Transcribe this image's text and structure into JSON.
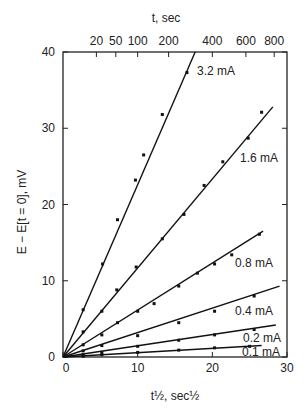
{
  "chart_data": {
    "type": "line",
    "title": "",
    "xlabel": "t½, sec½",
    "ylabel": "E − E[t = 0], mV",
    "top_axis_label": "t, sec",
    "xlim": [
      0,
      30
    ],
    "ylim": [
      0,
      40
    ],
    "x_ticks": [
      "0",
      "10",
      "20",
      "30"
    ],
    "y_ticks": [
      "0",
      "10",
      "20",
      "30",
      "40"
    ],
    "top_ticks": [
      "20",
      "50",
      "100",
      "200",
      "400",
      "600",
      "800"
    ],
    "grid": false,
    "legend_position": "inline labels at line ends",
    "series": [
      {
        "name": "3.2 mA",
        "line": [
          [
            0,
            0
          ],
          [
            17.7,
            40
          ]
        ],
        "points": [
          [
            2.7,
            6.2
          ],
          [
            5.3,
            12.2
          ],
          [
            7.3,
            18
          ],
          [
            9.7,
            23.2
          ],
          [
            10.8,
            26.5
          ],
          [
            13.3,
            31.8
          ],
          [
            16.6,
            37.3
          ]
        ]
      },
      {
        "name": "1.6 mA",
        "line": [
          [
            0,
            0
          ],
          [
            28.1,
            32.8
          ]
        ],
        "points": [
          [
            2.7,
            3.3
          ],
          [
            5.2,
            6
          ],
          [
            7.2,
            8.8
          ],
          [
            9.8,
            11.8
          ],
          [
            13.3,
            15.5
          ],
          [
            16.2,
            18.7
          ],
          [
            18.9,
            22.5
          ],
          [
            21.4,
            25.6
          ],
          [
            24.8,
            28.7
          ],
          [
            26.6,
            32.1
          ]
        ]
      },
      {
        "name": "0.8 mA",
        "line": [
          [
            0,
            0
          ],
          [
            26.8,
            16.5
          ]
        ],
        "points": [
          [
            2.7,
            1.6
          ],
          [
            5.2,
            2.9
          ],
          [
            7.3,
            4.5
          ],
          [
            10,
            6
          ],
          [
            12.2,
            7
          ],
          [
            15.5,
            9.3
          ],
          [
            18,
            11
          ],
          [
            20.3,
            12.2
          ],
          [
            22.6,
            13.4
          ],
          [
            26.3,
            16.1
          ]
        ]
      },
      {
        "name": "0.4 mA",
        "line": [
          [
            0,
            0
          ],
          [
            29,
            9.3
          ]
        ],
        "points": [
          [
            2.7,
            0.8
          ],
          [
            5.2,
            1.5
          ],
          [
            10,
            2.8
          ],
          [
            15.5,
            4.5
          ],
          [
            20.3,
            6
          ],
          [
            25.6,
            8
          ]
        ]
      },
      {
        "name": "0.2 mA",
        "line": [
          [
            0,
            0
          ],
          [
            28.5,
            4.2
          ]
        ],
        "points": [
          [
            2.7,
            0.3
          ],
          [
            5.2,
            0.6
          ],
          [
            10,
            1.4
          ],
          [
            15.5,
            2.2
          ],
          [
            20.3,
            2.9
          ],
          [
            25.6,
            3.6
          ]
        ]
      },
      {
        "name": "0.1 mA",
        "line": [
          [
            0,
            0
          ],
          [
            26.6,
            1.5
          ]
        ],
        "points": [
          [
            2.7,
            0.1
          ],
          [
            5.2,
            0.3
          ],
          [
            10,
            0.6
          ],
          [
            15.5,
            0.9
          ],
          [
            20.3,
            1.2
          ],
          [
            25,
            1.4
          ]
        ]
      }
    ]
  }
}
